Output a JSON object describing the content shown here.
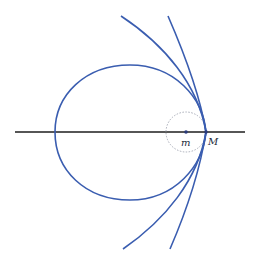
{
  "diagram": {
    "type": "conic-orbits",
    "colors": {
      "curve": "#3a5db0",
      "axis": "#1e1e1e",
      "dashed_circle": "#a8acb8",
      "point": "#2a3a7a",
      "background": "#ffffff"
    },
    "axis": {
      "x1": 15,
      "x2": 245,
      "y": 132
    },
    "labels": {
      "focus": "m",
      "vertex": "M"
    },
    "points": {
      "focus": {
        "x": 186,
        "y": 132
      },
      "vertex": {
        "x": 206,
        "y": 132
      }
    },
    "dashed_circle": {
      "cx": 186,
      "cy": 132,
      "r": 20
    },
    "curves": [
      {
        "name": "ellipse",
        "kind": "closed"
      },
      {
        "name": "parabola",
        "kind": "open"
      },
      {
        "name": "hyperbola",
        "kind": "open"
      }
    ]
  }
}
